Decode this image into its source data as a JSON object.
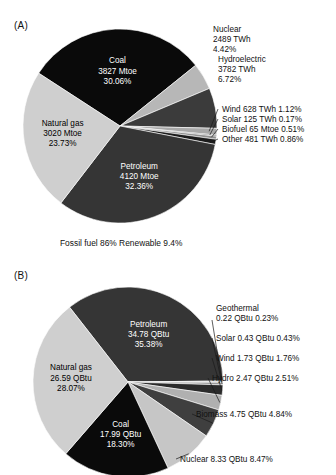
{
  "figure": {
    "panels": [
      {
        "id": "A",
        "label": "(A)",
        "caption": "Fossil fuel 86% Renewable 9.4%",
        "chart_data": {
          "type": "pie",
          "title": "(A)",
          "unit_note": "Mixed units as labelled (Mtoe / TWh)",
          "start_angle_deg": 0,
          "direction": "clockwise",
          "legend": "none",
          "categories": [
            "Coal",
            "Nuclear",
            "Hydroelectric",
            "Wind",
            "Solar",
            "Biofuel",
            "Other",
            "Petroleum",
            "Natural gas"
          ],
          "values": [
            30.06,
            4.42,
            6.72,
            1.12,
            0.17,
            0.51,
            0.86,
            32.36,
            23.73
          ],
          "slices": [
            {
              "name": "Coal",
              "amount": "3827 Mtoe",
              "percent": "30.06%",
              "value": 30.06,
              "color": "#0a0a0a",
              "label_mode": "inside",
              "text_color": "on-dark",
              "lines": [
                "Coal",
                "3827 Mtoe",
                "30.06%"
              ]
            },
            {
              "name": "Nuclear",
              "amount": "2489 TWh",
              "percent": "4.42%",
              "value": 4.42,
              "color": "#b7b7b7",
              "label_mode": "outside",
              "text_color": "on-light",
              "lines": [
                "Nuclear",
                "2489 TWh",
                "4.42%"
              ]
            },
            {
              "name": "Hydroelectric",
              "amount": "3782 TWh",
              "percent": "6.72%",
              "value": 6.72,
              "color": "#3b3b3b",
              "label_mode": "outside",
              "text_color": "on-light",
              "lines": [
                "Hydroelectric",
                "3782 TWh",
                "6.72%"
              ]
            },
            {
              "name": "Wind",
              "amount": "628 TWh",
              "percent": "1.12%",
              "value": 1.12,
              "color": "#a8a8a8",
              "label_mode": "leader",
              "text_color": "on-light",
              "lines": [
                "Wind 628 TWh 1.12%"
              ]
            },
            {
              "name": "Solar",
              "amount": "125 TWh",
              "percent": "0.17%",
              "value": 0.17,
              "color": "#2e2e2e",
              "label_mode": "leader",
              "text_color": "on-light",
              "lines": [
                "Solar 125 TWh 0.17%"
              ]
            },
            {
              "name": "Biofuel",
              "amount": "65 Mtoe",
              "percent": "0.51%",
              "value": 0.51,
              "color": "#8f8f8f",
              "label_mode": "leader",
              "text_color": "on-light",
              "lines": [
                "Biofuel 65 Mtoe 0.51%"
              ]
            },
            {
              "name": "Other",
              "amount": "481 TWh",
              "percent": "0.86%",
              "value": 0.86,
              "color": "#1c1c1c",
              "label_mode": "leader",
              "text_color": "on-light",
              "lines": [
                "Other 481 TWh 0.86%"
              ]
            },
            {
              "name": "Petroleum",
              "amount": "4120 Mtoe",
              "percent": "32.36%",
              "value": 32.36,
              "color": "#353535",
              "label_mode": "inside",
              "text_color": "on-dark",
              "lines": [
                "Petroleum",
                "4120 Mtoe",
                "32.36%"
              ]
            },
            {
              "name": "Natural gas",
              "amount": "3020 Mtoe",
              "percent": "23.73%",
              "value": 23.73,
              "color": "#cfcfcf",
              "label_mode": "inside",
              "text_color": "on-light",
              "lines": [
                "Natural gas",
                "3020 Mtoe",
                "23.73%"
              ]
            }
          ]
        }
      },
      {
        "id": "B",
        "label": "(B)",
        "caption": "",
        "chart_data": {
          "type": "pie",
          "title": "(B)",
          "unit_note": "QBtu",
          "start_angle_deg": 0,
          "direction": "clockwise",
          "legend": "none",
          "categories": [
            "Petroleum",
            "Geothermal",
            "Solar",
            "Wind",
            "Hydro",
            "Biomass",
            "Nuclear",
            "Coal",
            "Natural gas"
          ],
          "values": [
            35.38,
            0.23,
            0.43,
            1.76,
            2.51,
            4.84,
            8.47,
            18.3,
            28.07
          ],
          "slices": [
            {
              "name": "Petroleum",
              "amount": "34.78 QBtu",
              "percent": "35.38%",
              "value": 35.38,
              "color": "#353535",
              "label_mode": "inside",
              "text_color": "on-dark",
              "lines": [
                "Petroleum",
                "34.78 QBtu",
                "35.38%"
              ]
            },
            {
              "name": "Geothermal",
              "amount": "0.22 QBtu",
              "percent": "0.23%",
              "value": 0.23,
              "color": "#cfcfcf",
              "label_mode": "leader",
              "text_color": "on-light",
              "lines": [
                "Geothermal",
                "0.22 QBtu 0.23%"
              ]
            },
            {
              "name": "Solar",
              "amount": "0.43 QBtu",
              "percent": "0.43%",
              "value": 0.43,
              "color": "#9a9a9a",
              "label_mode": "leader",
              "text_color": "on-light",
              "lines": [
                "Solar 0.43 QBtu 0.43%"
              ]
            },
            {
              "name": "Wind",
              "amount": "1.73 QBtu",
              "percent": "1.76%",
              "value": 1.76,
              "color": "#2b2b2b",
              "label_mode": "leader",
              "text_color": "on-light",
              "lines": [
                "Wind 1.73 QBtu 1.76%"
              ]
            },
            {
              "name": "Hydro",
              "amount": "2.47 QBtu",
              "percent": "2.51%",
              "value": 2.51,
              "color": "#b0b0b0",
              "label_mode": "leader",
              "text_color": "on-light",
              "lines": [
                "Hydro 2.47 QBtu 2.51%"
              ]
            },
            {
              "name": "Biomass",
              "amount": "4.75 QBtu",
              "percent": "4.84%",
              "value": 4.84,
              "color": "#3f3f3f",
              "label_mode": "leader",
              "text_color": "on-light",
              "lines": [
                "Biomass 4.75 QBtu 4.84%"
              ]
            },
            {
              "name": "Nuclear",
              "amount": "8.33 QBtu",
              "percent": "8.47%",
              "value": 8.47,
              "color": "#c6c6c6",
              "label_mode": "leader",
              "text_color": "on-light",
              "lines": [
                "Nuclear 8.33 QBtu 8.47%"
              ]
            },
            {
              "name": "Coal",
              "amount": "17.99 QBtu",
              "percent": "18.30%",
              "value": 18.3,
              "color": "#0a0a0a",
              "label_mode": "inside",
              "text_color": "on-dark",
              "lines": [
                "Coal",
                "17.99 QBtu",
                "18.30%"
              ]
            },
            {
              "name": "Natural gas",
              "amount": "26.59 QBtu",
              "percent": "28.07%",
              "value": 28.07,
              "color": "#cfcfcf",
              "label_mode": "inside",
              "text_color": "on-light",
              "lines": [
                "Natural gas",
                "26.59 QBtu",
                "28.07%"
              ]
            }
          ]
        }
      }
    ]
  }
}
